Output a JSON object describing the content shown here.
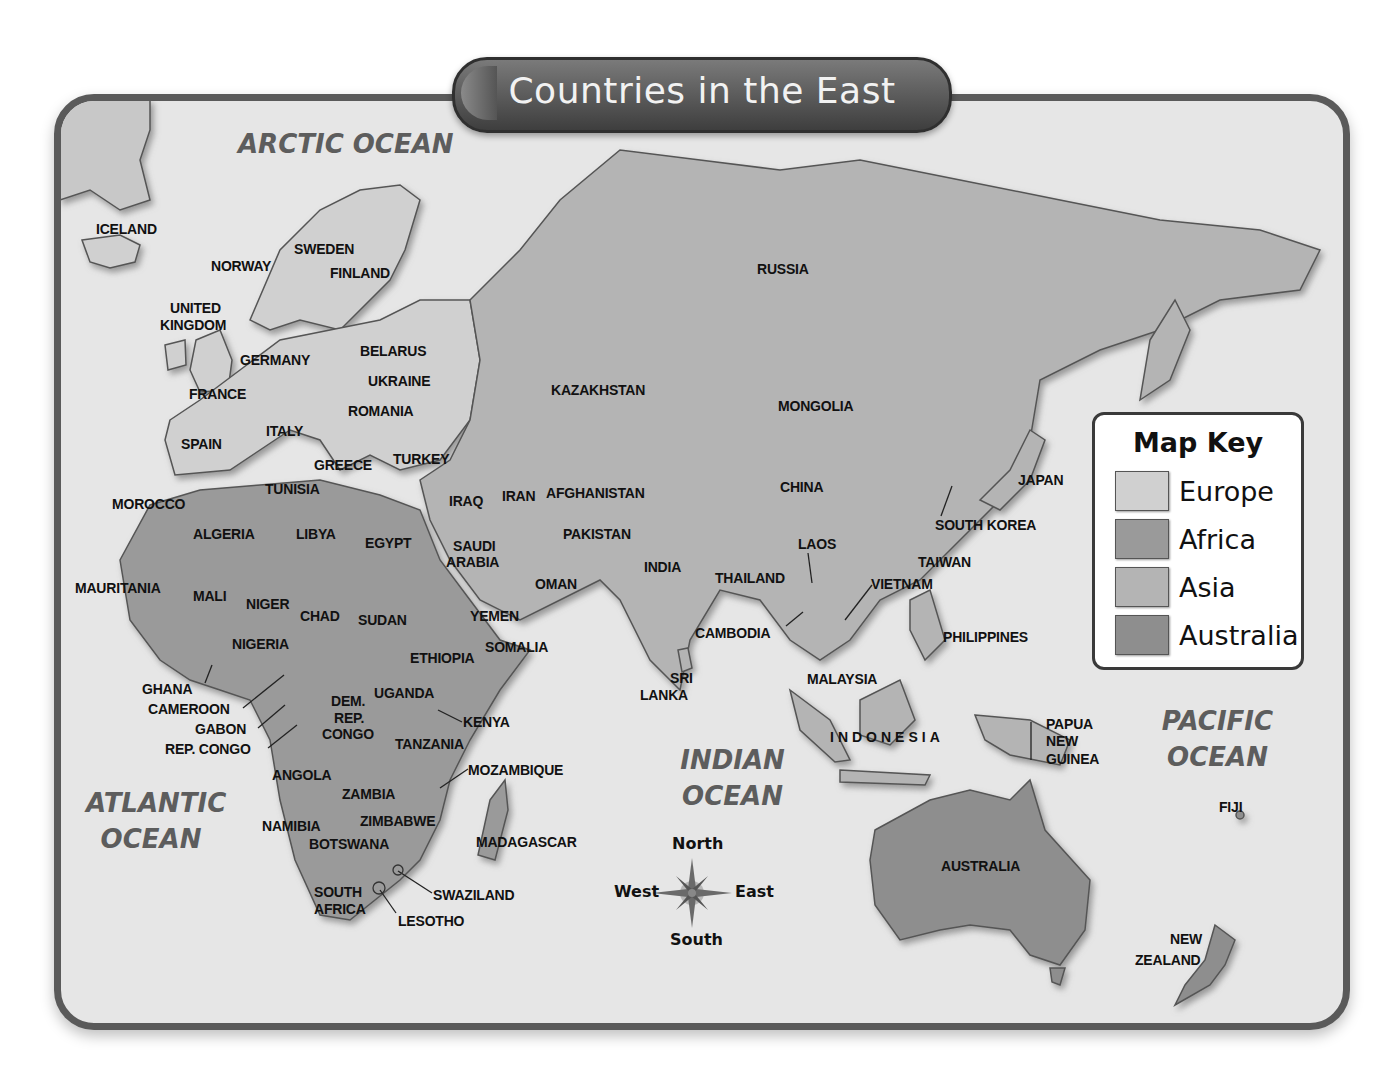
{
  "title": "Countries in the East",
  "colors": {
    "frame": "#5a5a5a",
    "ocean": "#e6e6e6",
    "europe": "#d0d0d0",
    "africa": "#9a9a9a",
    "asia": "#b4b4b4",
    "australia": "#8e8e8e",
    "border_line": "#555555"
  },
  "map_key": {
    "title": "Map Key",
    "items": [
      {
        "label": "Europe",
        "color": "#d0d0d0"
      },
      {
        "label": "Africa",
        "color": "#9a9a9a"
      },
      {
        "label": "Asia",
        "color": "#b4b4b4"
      },
      {
        "label": "Australia",
        "color": "#8e8e8e"
      }
    ]
  },
  "oceans": {
    "arctic": "ARCTIC  OCEAN",
    "atlantic_1": "ATLANTIC",
    "atlantic_2": "OCEAN",
    "indian_1": "INDIAN",
    "indian_2": "OCEAN",
    "pacific_1": "PACIFIC",
    "pacific_2": "OCEAN"
  },
  "compass": {
    "north": "North",
    "south": "South",
    "east": "East",
    "west": "West"
  },
  "countries": {
    "europe": [
      "ICELAND",
      "NORWAY",
      "SWEDEN",
      "FINLAND",
      "UNITED",
      "KINGDOM",
      "GERMANY",
      "BELARUS",
      "UKRAINE",
      "FRANCE",
      "ROMANIA",
      "SPAIN",
      "ITALY",
      "GREECE"
    ],
    "africa": [
      "MOROCCO",
      "TUNISIA",
      "ALGERIA",
      "LIBYA",
      "EGYPT",
      "MAURITANIA",
      "MALI",
      "NIGER",
      "CHAD",
      "SUDAN",
      "NIGERIA",
      "ETHIOPIA",
      "SOMALIA",
      "GHANA",
      "CAMEROON",
      "GABON",
      "REP. CONGO",
      "DEM.",
      "REP.",
      "CONGO",
      "UGANDA",
      "KENYA",
      "TANZANIA",
      "ANGOLA",
      "MOZAMBIQUE",
      "ZAMBIA",
      "NAMIBIA",
      "ZIMBABWE",
      "BOTSWANA",
      "MADAGASCAR",
      "SOUTH",
      "AFRICA",
      "SWAZILAND",
      "LESOTHO"
    ],
    "asia": [
      "RUSSIA",
      "KAZAKHSTAN",
      "MONGOLIA",
      "TURKEY",
      "IRAQ",
      "IRAN",
      "AFGHANISTAN",
      "SAUDI",
      "ARABIA",
      "PAKISTAN",
      "INDIA",
      "CHINA",
      "OMAN",
      "YEMEN",
      "SOUTH KOREA",
      "JAPAN",
      "LAOS",
      "TAIWAN",
      "THAILAND",
      "VIETNAM",
      "CAMBODIA",
      "PHILIPPINES",
      "SRI",
      "LANKA",
      "MALAYSIA",
      "INDONESIA",
      "PAPUA",
      "NEW",
      "GUINEA"
    ],
    "australia": [
      "AUSTRALIA",
      "FIJI",
      "NEW",
      "ZEALAND"
    ]
  }
}
